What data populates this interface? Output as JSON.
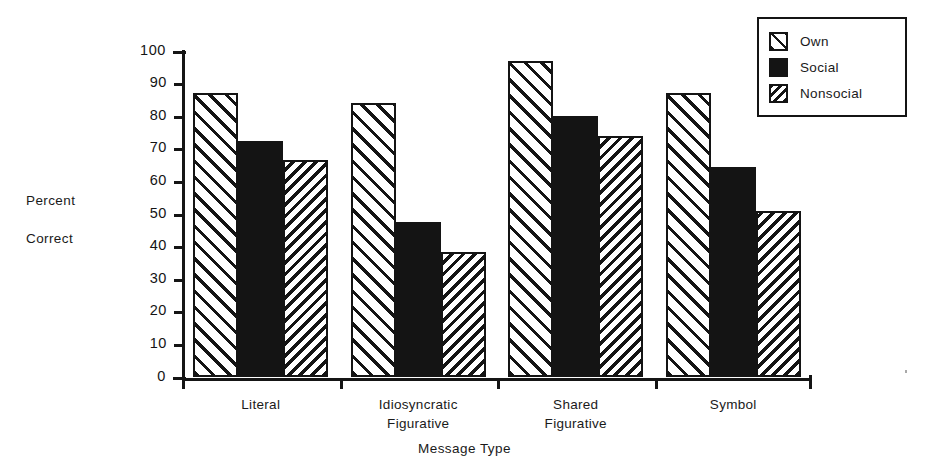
{
  "chart_data": {
    "type": "bar",
    "title": "",
    "xlabel": "Message Type",
    "ylabel": "Percent Correct",
    "ylabel_lines": [
      "Percent",
      "Correct"
    ],
    "categories": [
      "Literal",
      "Idiosyncratic Figurative",
      "Shared Figurative",
      "Symbol"
    ],
    "category_lines": [
      [
        "Literal"
      ],
      [
        "Idiosyncratic",
        "Figurative"
      ],
      [
        "Shared",
        "Figurative"
      ],
      [
        "Symbol"
      ]
    ],
    "series": [
      {
        "name": "Own",
        "pattern": "forward-diagonal-hatch",
        "values": [
          87,
          84,
          97,
          87
        ]
      },
      {
        "name": "Social",
        "pattern": "solid-black",
        "values": [
          72.5,
          47.5,
          80,
          64.5
        ]
      },
      {
        "name": "Nonsocial",
        "pattern": "back-diagonal-hatch",
        "values": [
          66.5,
          38.5,
          74,
          51
        ]
      }
    ],
    "ylim": [
      0,
      100
    ],
    "yticks": [
      0,
      10,
      20,
      30,
      40,
      50,
      60,
      70,
      80,
      90,
      100
    ],
    "ytick_labels": [
      "0",
      "10",
      "20",
      "30",
      "40",
      "50",
      "60",
      "70",
      "80",
      "90",
      "100"
    ],
    "grid": false,
    "legend_position": "upper-right",
    "colors": {
      "ink": "#141414",
      "background": "#ffffff"
    }
  },
  "legend": {
    "entries": [
      {
        "label": "Own",
        "swatch": "hatch-forward-swatch"
      },
      {
        "label": "Social",
        "swatch": "solid-black-swatch"
      },
      {
        "label": "Nonsocial",
        "swatch": "hatch-back-swatch"
      }
    ]
  }
}
